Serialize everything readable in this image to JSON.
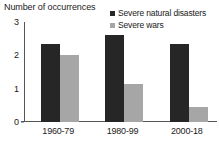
{
  "chart_data": {
    "type": "bar",
    "title": "",
    "xlabel": "",
    "ylabel": "Number of occurrences",
    "categories": [
      "1960-79",
      "1980-99",
      "2000-18"
    ],
    "series": [
      {
        "name": "Severe natural disasters",
        "color": "#262626",
        "values": [
          2.35,
          2.6,
          2.35
        ]
      },
      {
        "name": "Severe wars",
        "color": "#a6a6a6",
        "values": [
          2.0,
          1.15,
          0.45
        ]
      }
    ],
    "ylim": [
      0,
      3
    ],
    "yticks": [
      "0",
      "1",
      "2",
      "3"
    ],
    "ytick_values": [
      0,
      1,
      2,
      3
    ],
    "grid": false,
    "legend_position": "top-right",
    "axis_color": "#555555"
  }
}
